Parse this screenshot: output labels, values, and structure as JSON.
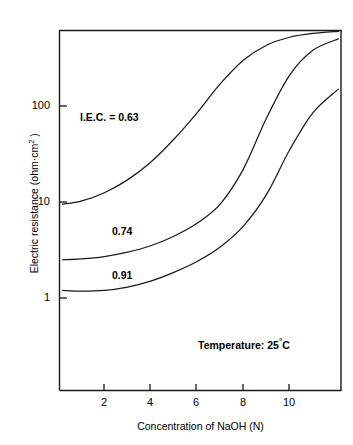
{
  "chart_data": {
    "type": "line",
    "title": "",
    "xlabel": "Concentration of NaOH (N)",
    "ylabel": "Electric resistance (ohm·cm²)",
    "ylabel_parts": {
      "main": "Electric resistance (ohm·cm",
      "sup": "2",
      "tail": " )"
    },
    "yscale": "log",
    "xscale": "linear",
    "xlim": [
      0,
      12.2
    ],
    "ylim": [
      0.38,
      1000
    ],
    "grid": false,
    "legend": "none (inline curve labels)",
    "xticks": [
      2,
      4,
      6,
      8,
      10
    ],
    "xtick_labels": [
      "2",
      "4",
      "6",
      "8",
      "10"
    ],
    "yticks": [
      1,
      10,
      100
    ],
    "ytick_labels": [
      "1",
      "10",
      "100"
    ],
    "series": [
      {
        "name": "I.E.C. = 0.63",
        "label": "I.E.C. = 0.63",
        "x": [
          0.2,
          1.0,
          2.0,
          3.0,
          4.0,
          5.0,
          6.0,
          7.0,
          8.0,
          9.0,
          10.0,
          11.0,
          12.1
        ],
        "y": [
          9.5,
          10.2,
          12.5,
          17.0,
          26.0,
          45.0,
          85.0,
          170.0,
          300.0,
          430.0,
          520.0,
          570.0,
          600.0
        ]
      },
      {
        "name": "0.74",
        "label": "0.74",
        "x": [
          0.2,
          1.0,
          2.0,
          3.0,
          4.0,
          5.0,
          6.0,
          7.0,
          8.0,
          9.0,
          10.0,
          11.0,
          12.1
        ],
        "y": [
          2.5,
          2.55,
          2.7,
          3.0,
          3.5,
          4.4,
          6.0,
          9.5,
          22.0,
          75.0,
          210.0,
          380.0,
          500.0
        ]
      },
      {
        "name": "0.91",
        "label": "0.91",
        "x": [
          0.2,
          1.0,
          2.0,
          3.0,
          4.0,
          5.0,
          6.0,
          7.0,
          8.0,
          9.0,
          10.0,
          11.0,
          12.1
        ],
        "y": [
          1.2,
          1.18,
          1.2,
          1.3,
          1.5,
          1.85,
          2.4,
          3.4,
          5.6,
          12.0,
          35.0,
          85.0,
          150.0
        ]
      }
    ],
    "annotations": [
      {
        "text": "I.E.C. = 0.63",
        "x_px": 80,
        "y_px": 118
      },
      {
        "text": "0.74",
        "x_px": 112,
        "y_px": 230
      },
      {
        "text": "0.91",
        "x_px": 112,
        "y_px": 273
      },
      {
        "text": "Temperature: 25°C",
        "x_px": 198,
        "y_px": 342
      }
    ],
    "temperature_note": {
      "prefix": "Temperature: 25",
      "degree": "°",
      "unit": "C"
    },
    "colors": {
      "axis": "#000000",
      "curve": "#1a1a1a",
      "background": "#ffffff"
    }
  },
  "axes": {
    "x_title": "Concentration of NaOH (N)",
    "y_title_main": "Electric resistance (ohm·cm",
    "y_title_sup": "2",
    "y_title_tail": " )",
    "x_tick_labels": [
      "2",
      "4",
      "6",
      "8",
      "10"
    ],
    "y_tick_labels": [
      "100",
      "10",
      "1"
    ]
  },
  "labels": {
    "iec_063": "I.E.C. = 0.63",
    "iec_074": "0.74",
    "iec_091": "0.91",
    "temperature_prefix": "Temperature: 25",
    "temperature_degree": "°",
    "temperature_unit": "C"
  }
}
